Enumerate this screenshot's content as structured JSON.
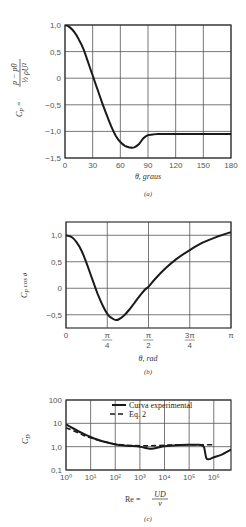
{
  "chart_data": [
    {
      "id": "a",
      "type": "line",
      "caption": "(a)",
      "title": "",
      "xlabel": "θ, graus",
      "ylabel": "C_P = (p − p0) / (½ ρ U²)",
      "xlim": [
        0,
        180
      ],
      "ylim": [
        -1.5,
        1.0
      ],
      "grid": true,
      "x_ticks": [
        0,
        30,
        60,
        90,
        120,
        150,
        180
      ],
      "x_tick_labels": [
        "0",
        "30",
        "60",
        "90",
        "120",
        "150",
        "180"
      ],
      "y_ticks": [
        1.0,
        0.5,
        0,
        -0.5,
        -1.0,
        -1.5
      ],
      "y_tick_labels": [
        "1,0",
        "0,5",
        "0",
        "−0,5",
        "−1,0",
        "−1,5"
      ],
      "series": [
        {
          "name": "C_P",
          "x": [
            0,
            5,
            10,
            15,
            20,
            25,
            30,
            35,
            40,
            45,
            50,
            55,
            60,
            65,
            70,
            75,
            80,
            85,
            90,
            95,
            100,
            120,
            150,
            180
          ],
          "values": [
            1.0,
            0.96,
            0.87,
            0.73,
            0.55,
            0.3,
            0.05,
            -0.2,
            -0.45,
            -0.68,
            -0.9,
            -1.08,
            -1.2,
            -1.27,
            -1.3,
            -1.3,
            -1.24,
            -1.13,
            -1.07,
            -1.06,
            -1.05,
            -1.05,
            -1.05,
            -1.05
          ]
        }
      ]
    },
    {
      "id": "b",
      "type": "line",
      "caption": "(b)",
      "title": "",
      "xlabel": "θ, rad",
      "ylabel": "C_P cos θ",
      "xlim": [
        0,
        3.14159
      ],
      "ylim": [
        -0.75,
        1.25
      ],
      "grid": true,
      "x_ticks": [
        0,
        0.7854,
        1.5708,
        2.3562,
        3.14159
      ],
      "x_tick_labels": [
        "0",
        "π/4",
        "π/2",
        "3π/4",
        "π"
      ],
      "y_ticks": [
        1.0,
        0.5,
        0,
        -0.5
      ],
      "y_tick_labels": [
        "1,0",
        "0,5",
        "0",
        "−0,5"
      ],
      "series": [
        {
          "name": "C_P cos θ",
          "x": [
            0,
            0.1,
            0.2,
            0.3,
            0.4,
            0.5,
            0.6,
            0.7,
            0.8,
            0.9,
            0.95,
            1.0,
            1.1,
            1.2,
            1.3,
            1.4,
            1.5,
            1.5708,
            1.7,
            1.9,
            2.1,
            2.3562,
            2.6,
            2.9,
            3.14159
          ],
          "values": [
            1.0,
            0.97,
            0.87,
            0.7,
            0.45,
            0.17,
            -0.1,
            -0.33,
            -0.5,
            -0.58,
            -0.6,
            -0.59,
            -0.52,
            -0.41,
            -0.28,
            -0.15,
            -0.03,
            0.03,
            0.18,
            0.38,
            0.55,
            0.72,
            0.86,
            0.98,
            1.06
          ]
        }
      ]
    },
    {
      "id": "c",
      "type": "line",
      "caption": "(c)",
      "title": "",
      "xlabel": "Re = UD / ν",
      "ylabel": "C_D",
      "xscale": "log",
      "yscale": "log",
      "xlim": [
        1,
        5000000
      ],
      "ylim": [
        0.1,
        100
      ],
      "grid": true,
      "x_ticks": [
        1,
        10,
        100,
        1000,
        10000,
        100000,
        1000000
      ],
      "x_tick_labels": [
        "10⁰",
        "10¹",
        "10²",
        "10³",
        "10⁴",
        "10⁵",
        "10⁶"
      ],
      "y_ticks": [
        100,
        10,
        1.0,
        0.1
      ],
      "y_tick_labels": [
        "100",
        "10",
        "1,0",
        "0,1"
      ],
      "legend": {
        "position": "upper right",
        "entries": [
          "Curva experimental",
          "Eq. 2"
        ]
      },
      "series": [
        {
          "name": "Curva experimental",
          "style": "solid",
          "x": [
            1,
            2,
            5,
            10,
            30,
            100,
            300,
            1000,
            2000,
            3000,
            5000,
            10000,
            30000,
            100000,
            200000,
            300000,
            400000,
            500000,
            700000,
            1000000,
            2000000,
            5000000
          ],
          "values": [
            9.0,
            6.0,
            3.6,
            2.6,
            1.7,
            1.25,
            1.1,
            1.0,
            0.85,
            0.82,
            0.9,
            1.05,
            1.15,
            1.2,
            1.2,
            1.18,
            0.95,
            0.32,
            0.3,
            0.35,
            0.45,
            0.75
          ]
        },
        {
          "name": "Eq. 2",
          "style": "dashed",
          "x": [
            1,
            2,
            5,
            10,
            30,
            100,
            300,
            1000,
            3000,
            10000,
            30000,
            100000,
            300000,
            1000000
          ],
          "values": [
            6.5,
            4.8,
            3.1,
            2.4,
            1.7,
            1.3,
            1.15,
            1.1,
            1.1,
            1.15,
            1.2,
            1.2,
            1.2,
            1.2
          ]
        }
      ]
    }
  ],
  "captions": {
    "a": "(a)",
    "b": "(b)",
    "c": "(c)"
  },
  "labels": {
    "a_xlabel": "θ,  graus",
    "b_xlabel": "θ, rad",
    "c_xlabel_lhs": "Re  =",
    "c_xlabel_num": "UD",
    "c_xlabel_den": "ν",
    "a_ylabel_lhs": "C",
    "a_ylabel_sub": "P",
    "a_ylabel_num": "p − p0",
    "a_ylabel_den": "½ ρU²",
    "b_ylabel": "C",
    "b_ylabel_sub": "P",
    "b_ylabel_rest": " cos θ",
    "c_ylabel": "C",
    "c_ylabel_sub": "D",
    "legend_solid": "Curva experimental",
    "legend_dashed": "Eq. 2"
  }
}
